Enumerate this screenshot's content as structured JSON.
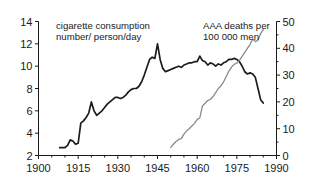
{
  "chart_data": {
    "type": "line",
    "title": "",
    "subtitle": "",
    "xlabel": "",
    "grid": false,
    "legend_position": "in-plot-annotations",
    "x_axis": {
      "ticks": [
        1900,
        1915,
        1930,
        1945,
        1960,
        1975,
        1990
      ],
      "tick_labels": [
        "1900",
        "1915",
        "1930",
        "1945",
        "1960",
        "1975",
        "1990"
      ],
      "xlim": [
        1900,
        1990
      ],
      "minor_tick_step": 5
    },
    "y_axis_left": {
      "label": "cigarette consumption number/ person/day",
      "label_line_1": "cigarette consumption",
      "label_line_2": "number/ person/day",
      "ticks": [
        2,
        4,
        6,
        8,
        10,
        12,
        14
      ],
      "tick_labels": [
        "2",
        "4",
        "6",
        "8",
        "10",
        "12",
        "14"
      ],
      "ylim": [
        2,
        14
      ]
    },
    "y_axis_right": {
      "label": "AAA deaths per 100 000 men",
      "label_line_1": "AAA deaths per",
      "label_line_2": "100 000 men",
      "ticks": [
        0,
        10,
        20,
        30,
        40,
        50
      ],
      "tick_labels": [
        "0",
        "10",
        "20",
        "30",
        "40",
        "50"
      ],
      "ylim": [
        0,
        50
      ]
    },
    "series": [
      {
        "name": "cigarette consumption number/ person/day",
        "axis": "left",
        "color": "#1c1c1c",
        "x": [
          1908,
          1910,
          1911,
          1912,
          1913,
          1914,
          1915,
          1916,
          1917,
          1918,
          1919,
          1920,
          1921,
          1922,
          1923,
          1924,
          1925,
          1926,
          1927,
          1928,
          1929,
          1930,
          1931,
          1932,
          1933,
          1934,
          1935,
          1936,
          1937,
          1938,
          1939,
          1940,
          1941,
          1942,
          1943,
          1944,
          1945,
          1946,
          1947,
          1948,
          1949,
          1950,
          1951,
          1952,
          1953,
          1954,
          1955,
          1956,
          1957,
          1958,
          1959,
          1960,
          1961,
          1962,
          1963,
          1964,
          1965,
          1966,
          1967,
          1968,
          1969,
          1970,
          1971,
          1972,
          1973,
          1974,
          1975,
          1976,
          1977,
          1978,
          1979,
          1980,
          1981,
          1982,
          1983,
          1984,
          1985
        ],
        "values": [
          2.7,
          2.7,
          2.9,
          3.4,
          3.3,
          3.0,
          3.1,
          4.9,
          5.1,
          5.4,
          5.8,
          6.8,
          6.0,
          5.6,
          5.8,
          6.0,
          6.3,
          6.6,
          6.8,
          7.0,
          7.2,
          7.2,
          7.1,
          7.2,
          7.4,
          7.7,
          7.9,
          8.0,
          8.0,
          8.2,
          8.6,
          9.2,
          9.9,
          10.6,
          10.8,
          10.7,
          12.0,
          10.6,
          9.8,
          9.5,
          9.6,
          9.7,
          9.8,
          9.9,
          10.0,
          9.9,
          10.1,
          10.2,
          10.3,
          10.3,
          10.4,
          10.4,
          10.9,
          10.5,
          10.4,
          10.1,
          10.3,
          10.2,
          10.0,
          10.2,
          10.1,
          10.3,
          10.4,
          10.6,
          10.6,
          10.7,
          10.6,
          10.4,
          10.0,
          9.5,
          9.3,
          9.4,
          9.3,
          9.0,
          8.0,
          7.0,
          6.7
        ]
      },
      {
        "name": "AAA deaths per 100 000 men",
        "axis": "right",
        "color": "#8a8a8a",
        "x": [
          1950,
          1951,
          1952,
          1953,
          1954,
          1955,
          1956,
          1957,
          1958,
          1959,
          1960,
          1961,
          1962,
          1963,
          1964,
          1965,
          1966,
          1967,
          1968,
          1969,
          1970,
          1971,
          1972,
          1973,
          1974,
          1975,
          1976,
          1977,
          1978,
          1979,
          1980,
          1981,
          1982,
          1983,
          1984,
          1985
        ],
        "values": [
          3.0,
          4.2,
          5.2,
          6.0,
          6.3,
          8.0,
          9.2,
          10.0,
          11.0,
          12.0,
          13.5,
          14.0,
          18.5,
          19.5,
          20.5,
          21.0,
          22.0,
          23.5,
          25.0,
          26.0,
          27.5,
          29.5,
          31.5,
          33.0,
          34.0,
          34.5,
          35.5,
          37.0,
          38.5,
          40.0,
          41.5,
          43.5,
          42.5,
          43.0,
          45.5,
          47.0
        ]
      }
    ],
    "annotations": [
      {
        "name": "left-series-annotation",
        "text": "cigarette consumption number/ person/day",
        "position": "top-left"
      },
      {
        "name": "right-series-annotation",
        "text": "AAA deaths per 100 000 men",
        "position": "top-right"
      }
    ]
  }
}
